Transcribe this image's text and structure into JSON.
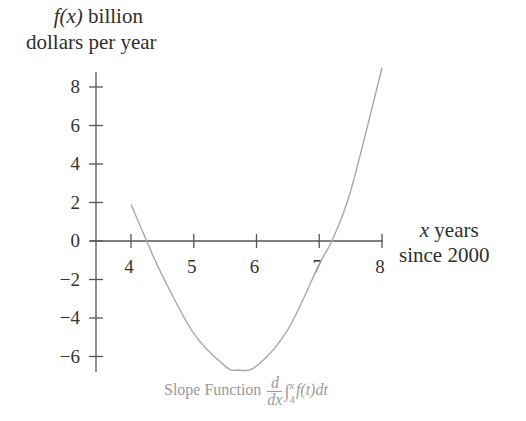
{
  "ylabel_line1_func": "f",
  "ylabel_line1_arg": "(x)",
  "ylabel_line1_rest": " billion",
  "ylabel_line2": "dollars per year",
  "xlabel_var": "x",
  "xlabel_line1_rest": " years",
  "xlabel_line2": "since 2000",
  "caption": {
    "prefix": "Slope Function ",
    "frac_num": "d",
    "frac_den": "dx",
    "integral": "∫",
    "upper": "x",
    "lower": "4",
    "integrand": "f(t)dt"
  },
  "colors": {
    "axis": "#555555",
    "curve": "#a8a8a8",
    "caption": "#9a9a9a"
  },
  "chart_data": {
    "type": "line",
    "xlabel": "x years since 2000",
    "ylabel": "f(x) billion dollars per year",
    "x_ticks": [
      4,
      5,
      6,
      7,
      8
    ],
    "y_ticks": [
      8,
      6,
      4,
      2,
      0,
      -2,
      -4,
      -6
    ],
    "xlim": [
      3.5,
      8
    ],
    "ylim": [
      -7,
      9
    ],
    "grid": false,
    "series": [
      {
        "name": "f(x)",
        "x": [
          4.0,
          4.25,
          4.5,
          5.0,
          5.5,
          5.7,
          6.0,
          6.5,
          7.0,
          7.2,
          7.5,
          8.0
        ],
        "values": [
          1.9,
          0.0,
          -1.8,
          -4.8,
          -6.5,
          -6.7,
          -6.5,
          -4.6,
          -1.2,
          0.0,
          2.6,
          9.0
        ]
      }
    ]
  }
}
